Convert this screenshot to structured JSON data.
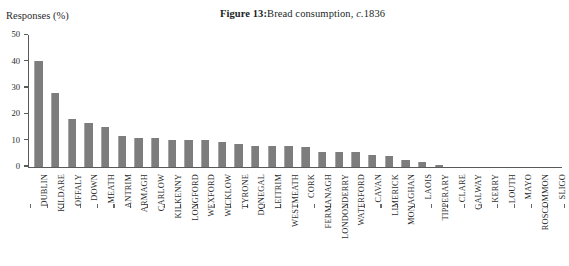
{
  "figure": {
    "label": "Figure 13:",
    "caption_prefix": "Bread consumption, ",
    "caption_italic": "c.",
    "caption_suffix": "1836",
    "full_title": "Figure 13: Bread consumption, c.1836"
  },
  "axis": {
    "y_title": "Responses (%)",
    "y_ticks": [
      "0",
      "10",
      "20",
      "30",
      "40",
      "50"
    ]
  },
  "chart_data": {
    "type": "bar",
    "xlabel": "",
    "ylabel": "Responses (%)",
    "ylim": [
      0,
      50
    ],
    "ytick_values": [
      0,
      10,
      20,
      30,
      40,
      50
    ],
    "grid": false,
    "legend": null,
    "bar_color": "#7d7d7d",
    "categories": [
      "DUBLIN",
      "KILDARE",
      "OFFALY",
      "DOWN",
      "MEATH",
      "ANTRIM",
      "ARMAGH",
      "CARLOW",
      "KILKENNY",
      "LONGFORD",
      "WEXFORD",
      "WICKLOW",
      "TYRONE",
      "DONEGAL",
      "LEITRIM",
      "WESTMEATH",
      "CORK",
      "FERMANAGH",
      "LONDONDERRY",
      "WATERFORD",
      "CAVAN",
      "LIMERICK",
      "MONAGHAN",
      "LAOIS",
      "TIPPERARY",
      "CLARE",
      "GALWAY",
      "KERRY",
      "LOUTH",
      "MAYO",
      "ROSCOMMON",
      "SLIGO"
    ],
    "values": [
      40,
      28,
      18,
      16.5,
      15,
      11.5,
      11,
      11,
      10,
      10,
      10,
      9.5,
      8.5,
      8,
      8,
      8,
      7.5,
      5.5,
      5.5,
      5.5,
      4.5,
      4,
      2.5,
      1.8,
      0.7,
      0,
      0,
      0,
      0,
      0,
      0,
      0
    ]
  }
}
